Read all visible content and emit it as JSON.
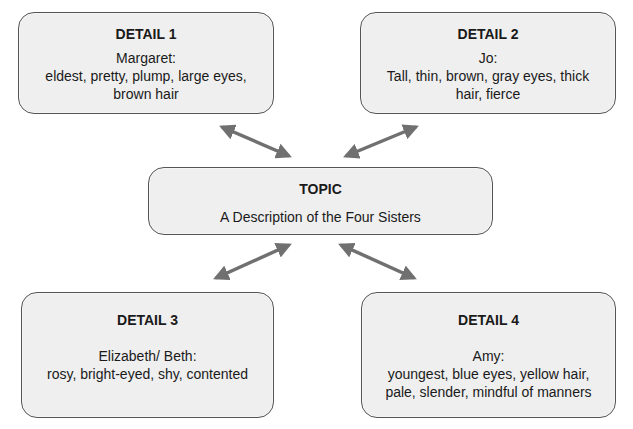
{
  "diagram": {
    "type": "topic-detail organizer",
    "arrow_color": "#707070",
    "box_fill": "#efefef",
    "box_border": "#555555",
    "topic": {
      "title": "TOPIC",
      "text": "A Description of the Four Sisters"
    },
    "details": [
      {
        "title": "DETAIL 1",
        "lines": [
          "Margaret:",
          "eldest, pretty, plump, large eyes,",
          "brown hair"
        ]
      },
      {
        "title": "DETAIL 2",
        "lines": [
          "Jo:",
          "Tall, thin, brown, gray eyes, thick",
          "hair, fierce"
        ]
      },
      {
        "title": "DETAIL 3",
        "lines": [
          "Elizabeth/ Beth:",
          "rosy, bright-eyed, shy, contented"
        ]
      },
      {
        "title": "DETAIL 4",
        "lines": [
          "Amy:",
          "youngest, blue eyes, yellow hair,",
          "pale, slender, mindful of manners"
        ]
      }
    ]
  }
}
